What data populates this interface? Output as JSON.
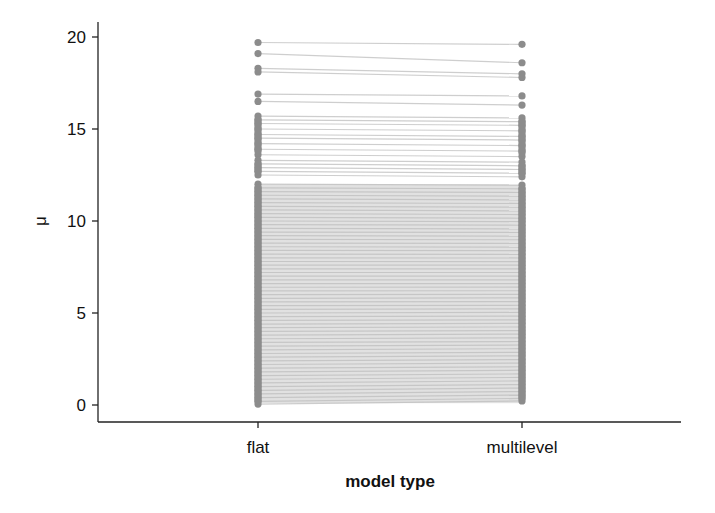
{
  "chart_data": {
    "type": "line",
    "subtype": "paired slope chart",
    "title": "",
    "xlabel": "model type",
    "ylabel": "μ",
    "categories": [
      "flat",
      "multilevel"
    ],
    "yticks": [
      0,
      5,
      10,
      15,
      20
    ],
    "ylim": [
      -1.0,
      20.9
    ],
    "grid": false,
    "legend": null,
    "colors": {
      "point": "#8c8c8c",
      "line": "#bdbdbd",
      "axis": "#222222"
    },
    "pairs": [
      [
        19.7,
        19.6
      ],
      [
        19.1,
        18.6
      ],
      [
        18.3,
        18.0
      ],
      [
        18.1,
        17.8
      ],
      [
        16.9,
        16.8
      ],
      [
        16.5,
        16.3
      ],
      [
        15.7,
        15.6
      ],
      [
        15.5,
        15.4
      ],
      [
        15.3,
        15.2
      ],
      [
        15.0,
        14.9
      ],
      [
        14.7,
        14.6
      ],
      [
        14.5,
        14.4
      ],
      [
        14.2,
        14.1
      ],
      [
        13.9,
        13.8
      ],
      [
        13.6,
        13.5
      ],
      [
        13.3,
        13.2
      ],
      [
        13.1,
        13.0
      ],
      [
        12.9,
        12.8
      ],
      [
        12.7,
        12.6
      ],
      [
        12.5,
        12.4
      ],
      [
        12.0,
        11.95
      ],
      [
        11.8,
        11.75
      ],
      [
        11.6,
        11.55
      ],
      [
        11.4,
        11.35
      ],
      [
        11.2,
        11.15
      ],
      [
        11.0,
        10.95
      ],
      [
        10.8,
        10.75
      ],
      [
        10.6,
        10.55
      ],
      [
        10.4,
        10.35
      ],
      [
        10.2,
        10.15
      ],
      [
        10.0,
        9.97
      ],
      [
        9.8,
        9.77
      ],
      [
        9.6,
        9.57
      ],
      [
        9.4,
        9.38
      ],
      [
        9.2,
        9.18
      ],
      [
        9.0,
        8.98
      ],
      [
        8.8,
        8.78
      ],
      [
        8.6,
        8.58
      ],
      [
        8.4,
        8.39
      ],
      [
        8.2,
        8.19
      ],
      [
        8.0,
        7.99
      ],
      [
        7.8,
        7.79
      ],
      [
        7.6,
        7.6
      ],
      [
        7.4,
        7.4
      ],
      [
        7.2,
        7.2
      ],
      [
        7.0,
        7.0
      ],
      [
        6.8,
        6.8
      ],
      [
        6.6,
        6.6
      ],
      [
        6.4,
        6.41
      ],
      [
        6.2,
        6.21
      ],
      [
        6.0,
        6.01
      ],
      [
        5.8,
        5.82
      ],
      [
        5.6,
        5.62
      ],
      [
        5.4,
        5.42
      ],
      [
        5.2,
        5.22
      ],
      [
        5.0,
        5.03
      ],
      [
        4.8,
        4.83
      ],
      [
        4.6,
        4.63
      ],
      [
        4.4,
        4.44
      ],
      [
        4.2,
        4.24
      ],
      [
        4.0,
        4.04
      ],
      [
        3.8,
        3.85
      ],
      [
        3.6,
        3.65
      ],
      [
        3.4,
        3.45
      ],
      [
        3.2,
        3.26
      ],
      [
        3.0,
        3.06
      ],
      [
        2.8,
        2.86
      ],
      [
        2.6,
        2.67
      ],
      [
        2.4,
        2.47
      ],
      [
        2.2,
        2.28
      ],
      [
        2.0,
        2.08
      ],
      [
        1.8,
        1.89
      ],
      [
        1.6,
        1.69
      ],
      [
        1.4,
        1.5
      ],
      [
        1.2,
        1.31
      ],
      [
        1.0,
        1.11
      ],
      [
        0.8,
        0.92
      ],
      [
        0.6,
        0.73
      ],
      [
        0.4,
        0.54
      ],
      [
        0.2,
        0.36
      ],
      [
        0.05,
        0.22
      ]
    ]
  }
}
